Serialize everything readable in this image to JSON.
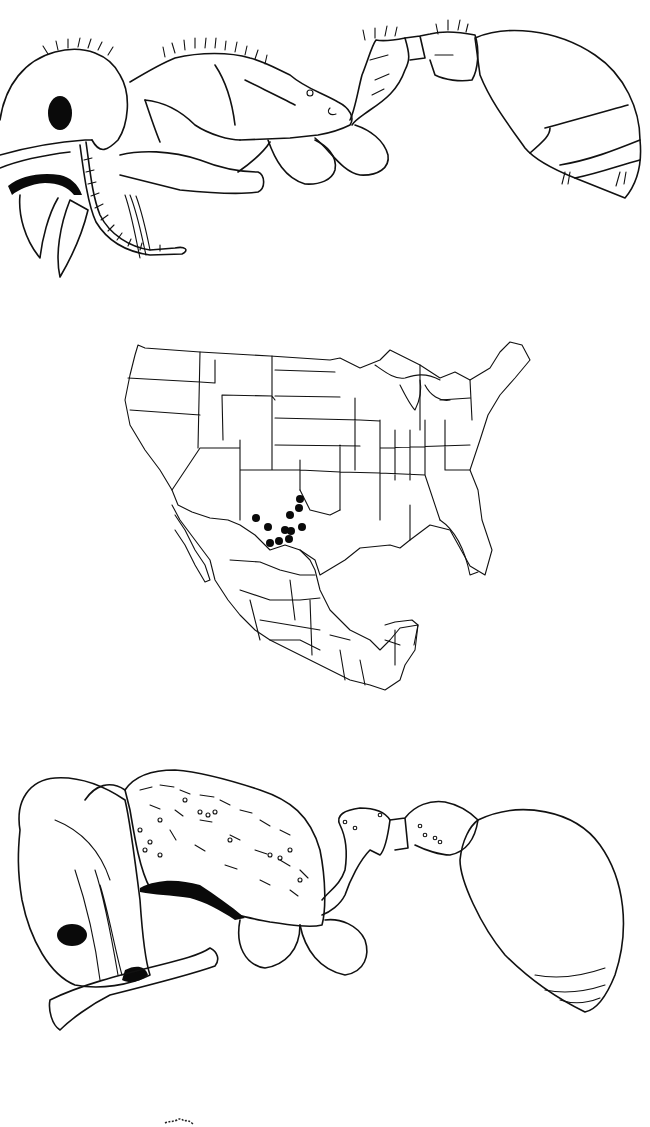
{
  "plate": {
    "description": "Scientific figure plate: ant illustrations and distribution map",
    "panels": [
      {
        "id": "top",
        "subject": "ant specimen, lateral view (worker)",
        "icon": "ant-lateral-illustration"
      },
      {
        "id": "middle",
        "subject": "distribution map of North America (USA and Mexico) with collection localities",
        "icon": "distribution-map"
      },
      {
        "id": "bottom",
        "subject": "ant specimen, oblique lateral view with sculptured mesosoma",
        "icon": "ant-oblique-illustration"
      }
    ],
    "footer_mark": "small ink smudge"
  },
  "map": {
    "region": "United States and Mexico",
    "marker_style": "solid black circle",
    "marker_color": "#0a0a0a",
    "locality_count": 11,
    "localities_region": "West Texas / southeastern New Mexico",
    "markers": [
      {
        "x": 300,
        "y": 499
      },
      {
        "x": 299,
        "y": 508
      },
      {
        "x": 290,
        "y": 515
      },
      {
        "x": 256,
        "y": 518
      },
      {
        "x": 268,
        "y": 527
      },
      {
        "x": 302,
        "y": 527
      },
      {
        "x": 285,
        "y": 530
      },
      {
        "x": 291,
        "y": 531
      },
      {
        "x": 289,
        "y": 539
      },
      {
        "x": 270,
        "y": 543
      },
      {
        "x": 279,
        "y": 541
      }
    ]
  },
  "colors": {
    "background": "#ffffff",
    "ink": "#111111"
  }
}
